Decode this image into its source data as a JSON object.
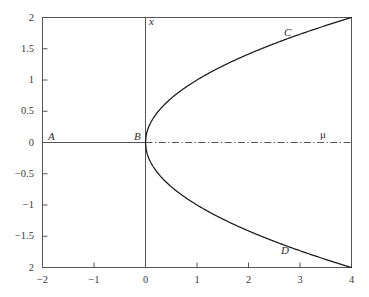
{
  "figure": {
    "kind": "bifurcation-diagram",
    "background_color": "#ffffff",
    "frame_color": "#555555",
    "curve_color": "#1a1a1a",
    "dashdot_color": "#555555"
  },
  "axes": {
    "x_axis_title": "μ",
    "y_axis_title": "x",
    "x_ticks": [
      "−2",
      "−1",
      "0",
      "1",
      "2",
      "3",
      "4"
    ],
    "x_tick_values": [
      -2,
      -1,
      0,
      1,
      2,
      3,
      4
    ],
    "y_ticks": [
      "2",
      "1.5",
      "1",
      "0.5",
      "0",
      "−0.5",
      "−1",
      "−1.5",
      "2"
    ],
    "y_tick_values": [
      2,
      1.5,
      1,
      0.5,
      0,
      -0.5,
      -1,
      -1.5,
      -2
    ],
    "xlim": [
      -2,
      4
    ],
    "ylim": [
      -2,
      2
    ],
    "grid": "off"
  },
  "annotations": [
    {
      "id": "A",
      "label": "A",
      "mu": -1.62,
      "x": 0.12
    },
    {
      "id": "B",
      "label": "B",
      "mu": -0.16,
      "x": 0.12
    },
    {
      "id": "C",
      "label": "C",
      "mu": 3.02,
      "x": 1.82
    },
    {
      "id": "D",
      "label": "D",
      "mu": 2.95,
      "x": -1.76
    }
  ],
  "chart_data": {
    "type": "line",
    "title": "",
    "xlabel": "μ",
    "ylabel": "x",
    "xlim": [
      -2,
      4
    ],
    "ylim": [
      -2,
      2
    ],
    "grid": "off",
    "legend": "none",
    "series": [
      {
        "name": "trivial branch (x = 0)",
        "style": "solid",
        "x": [
          -2,
          -1.5,
          -1,
          -0.5,
          0
        ],
        "values": [
          0,
          0,
          0,
          0,
          0
        ]
      },
      {
        "name": "unstable trivial branch (x = 0, μ > 0)",
        "style": "dash-dot",
        "x": [
          0,
          1,
          2,
          3,
          4
        ],
        "values": [
          0,
          0,
          0,
          0,
          0
        ]
      },
      {
        "name": "upper branch x = +√μ",
        "style": "solid",
        "x": [
          0,
          0.1,
          0.25,
          0.5,
          0.75,
          1,
          1.5,
          2,
          2.5,
          3,
          3.5,
          4
        ],
        "values": [
          0,
          0.316,
          0.5,
          0.707,
          0.866,
          1,
          1.225,
          1.414,
          1.581,
          1.732,
          1.871,
          2
        ]
      },
      {
        "name": "lower branch x = −√μ",
        "style": "solid",
        "x": [
          0,
          0.1,
          0.25,
          0.5,
          0.75,
          1,
          1.5,
          2,
          2.5,
          3,
          3.5,
          4
        ],
        "values": [
          0,
          -0.316,
          -0.5,
          -0.707,
          -0.866,
          -1,
          -1.225,
          -1.414,
          -1.581,
          -1.732,
          -1.871,
          -2
        ]
      }
    ]
  }
}
